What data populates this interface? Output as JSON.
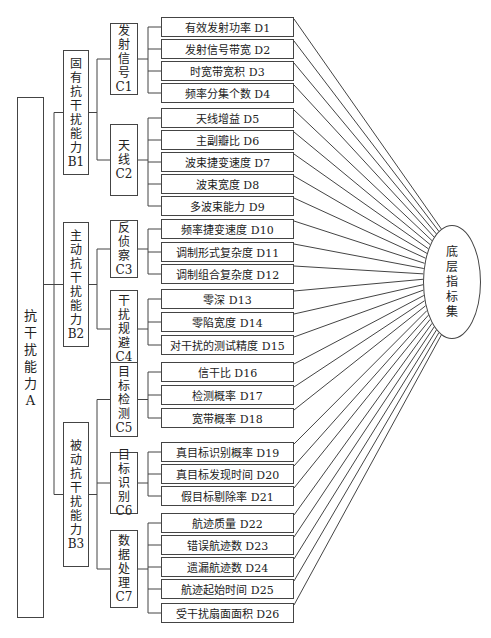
{
  "root": {
    "label": "抗干扰能力A",
    "chars": [
      "抗",
      "干",
      "扰",
      "能",
      "力",
      "A"
    ]
  },
  "target": {
    "label": "底层指标集",
    "chars": [
      "底",
      "层",
      "指",
      "标",
      "集"
    ]
  },
  "b_nodes": [
    {
      "id": "B1",
      "label": "固有抗干扰能力B1",
      "chars": [
        "固",
        "有",
        "抗",
        "干",
        "扰",
        "能",
        "力",
        "B1"
      ],
      "top": 50,
      "height": 125
    },
    {
      "id": "B2",
      "label": "主动抗干扰能力B2",
      "chars": [
        "主",
        "动",
        "抗",
        "干",
        "扰",
        "能",
        "力",
        "B2"
      ],
      "top": 222,
      "height": 125
    },
    {
      "id": "B3",
      "label": "被动抗干扰能力B3",
      "chars": [
        "被",
        "动",
        "抗",
        "干",
        "扰",
        "能",
        "力",
        "B3"
      ],
      "top": 422,
      "height": 145
    }
  ],
  "c_nodes": [
    {
      "id": "C1",
      "parent": "B1",
      "label": "发射信号C1",
      "chars": [
        "发",
        "射",
        "信",
        "号",
        "C1"
      ],
      "top": 23,
      "height": 72
    },
    {
      "id": "C2",
      "parent": "B1",
      "label": "天线C2",
      "chars": [
        "天",
        "线",
        "C2"
      ],
      "top": 124,
      "height": 72
    },
    {
      "id": "C3",
      "parent": "B2",
      "label": "反侦察C3",
      "chars": [
        "反",
        "侦",
        "察",
        "C3"
      ],
      "top": 220,
      "height": 58
    },
    {
      "id": "C4",
      "parent": "B2",
      "label": "干扰规避C4",
      "chars": [
        "干",
        "扰",
        "规",
        "避",
        "C4"
      ],
      "top": 290,
      "height": 78
    },
    {
      "id": "C5",
      "parent": "B3",
      "label": "目标检测C5",
      "chars": [
        "目",
        "标",
        "检",
        "测",
        "C5"
      ],
      "top": 362,
      "height": 75
    },
    {
      "id": "C6",
      "parent": "B3",
      "label": "目标识别C6",
      "chars": [
        "目",
        "标",
        "识",
        "别",
        "C6"
      ],
      "top": 452,
      "height": 62
    },
    {
      "id": "C7",
      "parent": "B3",
      "label": "数据处理C7",
      "chars": [
        "数",
        "据",
        "处",
        "理",
        "C7"
      ],
      "top": 530,
      "height": 78
    }
  ],
  "d_nodes": [
    {
      "id": "D1",
      "parent": "C1",
      "label": "有效发射功率 D1",
      "top": 17
    },
    {
      "id": "D2",
      "parent": "C1",
      "label": "发射信号带宽 D2",
      "top": 39
    },
    {
      "id": "D3",
      "parent": "C1",
      "label": "时宽带宽积 D3",
      "top": 61
    },
    {
      "id": "D4",
      "parent": "C1",
      "label": "频率分集个数 D4",
      "top": 83
    },
    {
      "id": "D5",
      "parent": "C2",
      "label": "天线增益 D5",
      "top": 108
    },
    {
      "id": "D6",
      "parent": "C2",
      "label": "主副瓣比 D6",
      "top": 130
    },
    {
      "id": "D7",
      "parent": "C2",
      "label": "波束捷变速度 D7",
      "top": 152
    },
    {
      "id": "D8",
      "parent": "C2",
      "label": "波束宽度 D8",
      "top": 174
    },
    {
      "id": "D9",
      "parent": "C2",
      "label": "多波束能力 D9",
      "top": 196
    },
    {
      "id": "D10",
      "parent": "C3",
      "label": "频率捷变速度 D10",
      "top": 219
    },
    {
      "id": "D11",
      "parent": "C3",
      "label": "调制形式复杂度 D11",
      "top": 242
    },
    {
      "id": "D12",
      "parent": "C3",
      "label": "调制组合复杂度 D12",
      "top": 264
    },
    {
      "id": "D13",
      "parent": "C4",
      "label": "零深 D13",
      "top": 289
    },
    {
      "id": "D14",
      "parent": "C4",
      "label": "零陷宽度 D14",
      "top": 312
    },
    {
      "id": "D15",
      "parent": "C4",
      "label": "对干扰的测试精度 D15",
      "top": 335
    },
    {
      "id": "D16",
      "parent": "C5",
      "label": "信干比 D16",
      "top": 362
    },
    {
      "id": "D17",
      "parent": "C5",
      "label": "检测概率 D17",
      "top": 385
    },
    {
      "id": "D18",
      "parent": "C5",
      "label": "宽带概率 D18",
      "top": 408
    },
    {
      "id": "D19",
      "parent": "C6",
      "label": "真目标识别概率 D19",
      "top": 442
    },
    {
      "id": "D20",
      "parent": "C6",
      "label": "真目标发现时间 D20",
      "top": 464
    },
    {
      "id": "D21",
      "parent": "C6",
      "label": "假目标剔除率 D21",
      "top": 486
    },
    {
      "id": "D22",
      "parent": "C7",
      "label": "航迹质量 D22",
      "top": 513
    },
    {
      "id": "D23",
      "parent": "C7",
      "label": "错误航迹数 D23",
      "top": 535
    },
    {
      "id": "D24",
      "parent": "C7",
      "label": "遗漏航迹数 D24",
      "top": 557
    },
    {
      "id": "D25",
      "parent": "C7",
      "label": "航迹起始时间 D25",
      "top": 579
    },
    {
      "id": "D26",
      "parent": "C7",
      "label": "受干扰扇面面积 D26",
      "top": 603
    }
  ],
  "colors": {
    "line": "#444444",
    "background": "#ffffff",
    "text": "#222222"
  }
}
